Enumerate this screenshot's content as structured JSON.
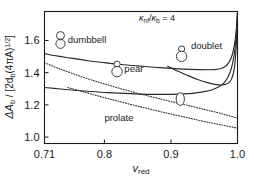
{
  "chart_data": {
    "type": "line",
    "title": "",
    "annotation": "κ_nf/κ_b = 4",
    "annotation_parts": {
      "kappa1": "κ",
      "kappa1_sub": "nf",
      "slash": "/",
      "kappa2": "κ",
      "kappa2_sub": "b",
      "equals": " = 4"
    },
    "xlabel": "v_red",
    "xlabel_parts": {
      "main": "v",
      "sub": "red"
    },
    "ylabel": "ΔA_b / [2d_b(4πA)^(1/2)]",
    "ylabel_parts": {
      "delta": "ΔA",
      "delta_sub": "b",
      "mid": " / [2d",
      "mid_sub": "b",
      "tail": "(4πA)",
      "exp": "1/2",
      "close": "]"
    },
    "xlim": [
      0.71,
      1.0
    ],
    "ylim": [
      0.96,
      1.78
    ],
    "xticks": [
      0.71,
      0.8,
      0.9,
      1.0
    ],
    "xtick_labels": [
      "0.71",
      "0.8",
      "0.9",
      "1.0"
    ],
    "yticks": [
      1.0,
      1.2,
      1.4,
      1.6
    ],
    "ytick_labels": [
      "1.0",
      "1.2",
      "1.4",
      "1.6"
    ],
    "grid": false,
    "legend": "inline-labels",
    "series": [
      {
        "name": "dumbbell",
        "style": "solid",
        "label": "dumbbell",
        "label_x": 0.745,
        "label_y": 1.605,
        "x": [
          0.71,
          0.73,
          0.75,
          0.775,
          0.8,
          0.825,
          0.85,
          0.875,
          0.9,
          0.92,
          0.94,
          0.955,
          0.965,
          0.975,
          0.982,
          0.988,
          0.992,
          0.995,
          0.997,
          0.999,
          1.0
        ],
        "y": [
          1.518,
          1.503,
          1.49,
          1.474,
          1.462,
          1.451,
          1.442,
          1.434,
          1.427,
          1.422,
          1.419,
          1.418,
          1.419,
          1.426,
          1.44,
          1.47,
          1.51,
          1.565,
          1.62,
          1.7,
          1.77
        ]
      },
      {
        "name": "prolate",
        "style": "solid",
        "label": "prolate",
        "label_x": 0.8,
        "label_y": 1.12,
        "x": [
          0.71,
          0.73,
          0.755,
          0.78,
          0.805,
          0.83,
          0.855,
          0.88,
          0.9,
          0.92,
          0.935,
          0.95,
          0.962,
          0.972,
          0.98,
          0.986,
          0.991,
          0.995,
          0.997,
          0.999,
          1.0
        ],
        "y": [
          1.308,
          1.3,
          1.291,
          1.283,
          1.276,
          1.271,
          1.267,
          1.265,
          1.265,
          1.268,
          1.273,
          1.282,
          1.294,
          1.312,
          1.338,
          1.375,
          1.43,
          1.51,
          1.58,
          1.69,
          1.77
        ]
      },
      {
        "name": "pear",
        "style": "dotted",
        "label": "pear",
        "label_x": 0.83,
        "label_y": 1.42,
        "x": [
          0.71,
          0.73,
          0.75,
          0.775,
          0.8,
          0.825,
          0.85,
          0.875,
          0.9,
          0.925,
          0.95,
          0.97,
          0.985,
          1.0
        ],
        "y": [
          1.462,
          1.428,
          1.398,
          1.362,
          1.33,
          1.3,
          1.272,
          1.246,
          1.221,
          1.197,
          1.172,
          1.152,
          1.135,
          1.118
        ]
      },
      {
        "name": "prolate-dotted-lower",
        "style": "dotted",
        "label": "",
        "x": [
          0.745,
          0.775,
          0.8,
          0.825,
          0.85,
          0.875,
          0.9,
          0.925,
          0.95,
          0.975,
          1.0
        ],
        "y": [
          1.308,
          1.273,
          1.245,
          1.218,
          1.192,
          1.167,
          1.143,
          1.12,
          1.097,
          1.076,
          1.055
        ]
      },
      {
        "name": "doublet",
        "style": "solid",
        "label": "doublet",
        "label_x": 0.93,
        "label_y": 1.565,
        "x": [
          0.895,
          0.91,
          0.925,
          0.94,
          0.955,
          0.968,
          0.978,
          0.986,
          0.991,
          0.995,
          0.998,
          1.0
        ],
        "y": [
          1.44,
          1.41,
          1.383,
          1.358,
          1.338,
          1.326,
          1.324,
          1.335,
          1.36,
          1.42,
          1.56,
          1.77
        ]
      }
    ],
    "shape_icons": [
      {
        "name": "dumbbell-icon",
        "shape": "dumbbell",
        "x": 0.734,
        "y": 1.605
      },
      {
        "name": "pear-icon",
        "shape": "pear",
        "x": 0.819,
        "y": 1.425
      },
      {
        "name": "doublet-icon",
        "shape": "pear",
        "x": 0.916,
        "y": 1.52
      },
      {
        "name": "prolate-icon",
        "shape": "ellipse",
        "x": 0.914,
        "y": 1.236
      }
    ]
  }
}
